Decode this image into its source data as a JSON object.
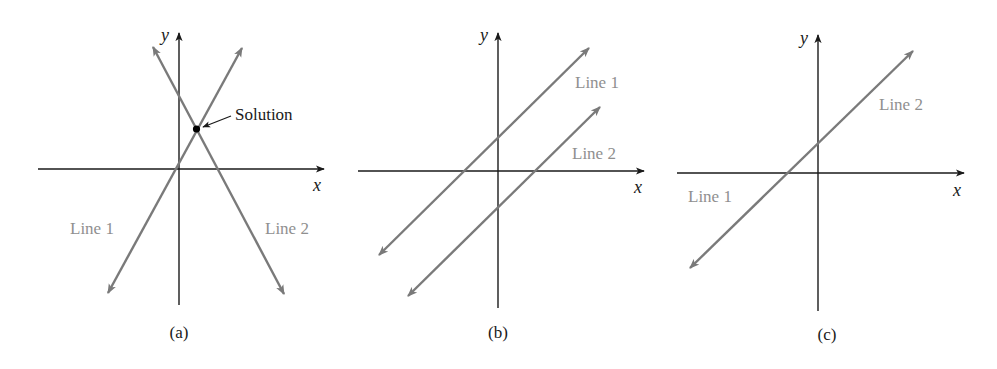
{
  "figure": {
    "panels": [
      {
        "id": "a",
        "caption": "(a)",
        "x_axis_label": "x",
        "y_axis_label": "y",
        "line1_label": "Line 1",
        "line2_label": "Line 2",
        "annotation": "Solution",
        "description": "Two lines intersecting at one point (one solution)"
      },
      {
        "id": "b",
        "caption": "(b)",
        "x_axis_label": "x",
        "y_axis_label": "y",
        "line1_label": "Line 1",
        "line2_label": "Line 2",
        "description": "Two parallel lines (no solution)"
      },
      {
        "id": "c",
        "caption": "(c)",
        "x_axis_label": "x",
        "y_axis_label": "y",
        "line1_label": "Line 1",
        "line2_label": "Line 2",
        "description": "Coincident lines (infinitely many solutions)"
      }
    ],
    "colors": {
      "axis": "#1a1a1a",
      "line": "#7a7a7a",
      "line_label": "#8f8f8f"
    }
  }
}
